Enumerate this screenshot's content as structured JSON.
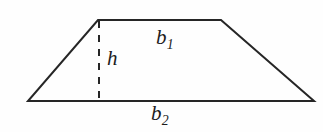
{
  "figure": {
    "name": "trapezoid-diagram",
    "background_color": "#fefefe",
    "stroke_color": "#262626",
    "stroke_width": 2,
    "labels": {
      "top_base": "b",
      "top_base_subscript": "1",
      "height": "h",
      "bottom_base": "b",
      "bottom_base_subscript": "2"
    },
    "geometry": {
      "top_left": [
        98,
        20
      ],
      "top_right": [
        221,
        20
      ],
      "bottom_right": [
        314,
        101
      ],
      "bottom_left": [
        28,
        101
      ],
      "height_line_x": 99,
      "height_line_top_y": 21,
      "height_line_bottom_y": 100,
      "height_line_dash": "7 7"
    }
  }
}
